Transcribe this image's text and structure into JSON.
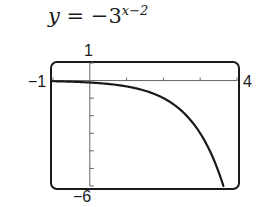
{
  "title": {
    "lhs": "y",
    "equals": "=",
    "base": "−3",
    "exponent": "x−2"
  },
  "window": {
    "xmin_label": "−1",
    "xmax_label": "4",
    "ymax_label": "1",
    "ymin_label": "−6"
  },
  "chart_data": {
    "type": "line",
    "xlabel": "",
    "ylabel": "",
    "xlim": [
      -1,
      4
    ],
    "ylim": [
      -6,
      1
    ],
    "x_ticks": [
      -1,
      0,
      1,
      2,
      3,
      4
    ],
    "y_ticks": [
      1,
      0,
      -1,
      -2,
      -3,
      -4,
      -5,
      -6
    ],
    "grid": false,
    "legend": "none",
    "series": [
      {
        "name": "y = −3^(x−2)",
        "x": [
          -1,
          -0.5,
          0,
          0.5,
          1,
          1.5,
          2,
          2.5,
          3,
          3.5,
          3.63
        ],
        "values": [
          -0.037,
          -0.064,
          -0.111,
          -0.192,
          -0.333,
          -0.577,
          -1.0,
          -1.732,
          -3.0,
          -5.196,
          -6.0
        ]
      }
    ],
    "colors": {
      "curve": "#1a1a1a",
      "frame": "#1a1a1a",
      "axes": "#555555"
    }
  }
}
